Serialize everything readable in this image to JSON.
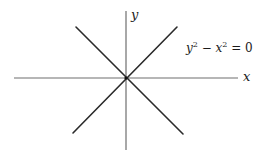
{
  "figure": {
    "axes": {
      "x_label": "x",
      "y_label": "y",
      "origin": [
        126,
        78
      ]
    },
    "equation": {
      "y_var": "y",
      "y_exp": "2",
      "minus": " − ",
      "x_var": "x",
      "x_exp": "2",
      "rhs": " = 0",
      "full_text": "y² − x² = 0"
    },
    "curves": [
      {
        "name": "y = x",
        "description": "line through origin with slope +1"
      },
      {
        "name": "y = -x",
        "description": "line through origin with slope -1"
      }
    ]
  }
}
